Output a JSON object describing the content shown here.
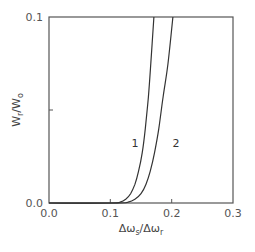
{
  "chart_data": {
    "type": "line",
    "title": "",
    "xlabel": "Δω_s/Δω_r",
    "ylabel": "W_r/W_o",
    "xlim": [
      0.0,
      0.3
    ],
    "ylim": [
      0.0,
      0.1
    ],
    "xticks": [
      "0.0",
      "0.1",
      "0.2",
      "0.3"
    ],
    "yticks": [
      "0.0",
      "0.1"
    ],
    "grid": false,
    "legend": "none; curves labeled inline with 1 and 2",
    "series": [
      {
        "name": "1",
        "x": [
          0.0,
          0.1,
          0.116,
          0.125,
          0.133,
          0.14,
          0.146,
          0.152,
          0.157,
          0.162,
          0.166,
          0.171
        ],
        "y": [
          0.0,
          0.0,
          0.0005,
          0.002,
          0.005,
          0.01,
          0.017,
          0.027,
          0.04,
          0.057,
          0.075,
          0.1
        ]
      },
      {
        "name": "2",
        "x": [
          0.0,
          0.11,
          0.129,
          0.14,
          0.15,
          0.158,
          0.165,
          0.172,
          0.179,
          0.186,
          0.194,
          0.202
        ],
        "y": [
          0.0,
          0.0,
          0.0005,
          0.002,
          0.005,
          0.01,
          0.017,
          0.027,
          0.04,
          0.057,
          0.075,
          0.1
        ]
      }
    ],
    "annotations": [
      {
        "text": "1",
        "x": 0.14,
        "y": 0.032
      },
      {
        "text": "2",
        "x": 0.207,
        "y": 0.032
      }
    ]
  },
  "labels": {
    "x_axis_main": "Δω",
    "x_axis_sub1": "s",
    "x_axis_slash": "/Δω",
    "x_axis_sub2": "r",
    "y_axis_main1": "W",
    "y_axis_sub1": "r",
    "y_axis_slash": "/W",
    "y_axis_sub2": "o",
    "xtick_0": "0.0",
    "xtick_1": "0.1",
    "xtick_2": "0.2",
    "xtick_3": "0.3",
    "ytick_0": "0.0",
    "ytick_1": "0.1",
    "curve_1": "1",
    "curve_2": "2"
  }
}
